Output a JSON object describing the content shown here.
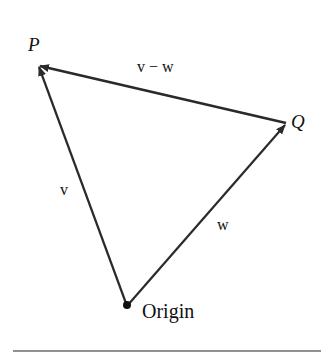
{
  "diagram": {
    "type": "vector-triangle",
    "points": {
      "P": {
        "label": "P",
        "x": 38,
        "y": 65
      },
      "Q": {
        "label": "Q",
        "x": 286,
        "y": 123
      },
      "origin": {
        "label": "Origin",
        "x": 127,
        "y": 306
      }
    },
    "vectors": [
      {
        "name": "v",
        "label": "v",
        "from": "origin",
        "to": "P"
      },
      {
        "name": "w",
        "label": "w",
        "from": "origin",
        "to": "Q"
      },
      {
        "name": "v-minus-w",
        "label": "v − w",
        "from": "Q",
        "to": "P"
      }
    ],
    "colors": {
      "stroke": "#2a2a2a",
      "text": "#111111",
      "background": "#ffffff"
    }
  }
}
